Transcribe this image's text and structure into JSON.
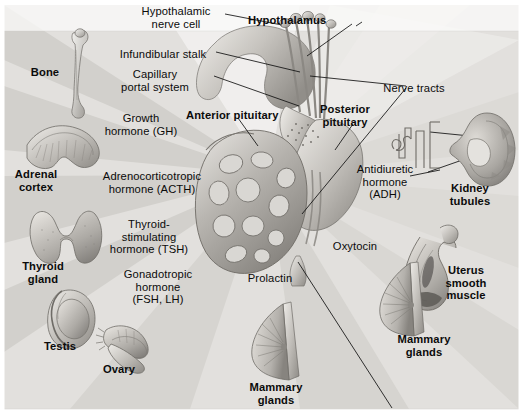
{
  "figure": {
    "width": 523,
    "height": 418,
    "background_color": "#e8e7e5",
    "border_color": "#ffffff",
    "line_color": "#1a1a1a"
  },
  "structures": [
    {
      "id": "hypothalamic-nerve-cell",
      "label": "Hypothalamic\nnerve cell",
      "bold": false,
      "x": 176,
      "y": 5,
      "anchor": "center"
    },
    {
      "id": "hypothalamus",
      "label": "Hypothalamus",
      "bold": true,
      "x": 248,
      "y": 14,
      "anchor": "left"
    },
    {
      "id": "infundibular-stalk",
      "label": "Infundibular stalk",
      "bold": false,
      "x": 163,
      "y": 48,
      "anchor": "center"
    },
    {
      "id": "nerve-tracts",
      "label": "Nerve tracts",
      "bold": false,
      "x": 414,
      "y": 82,
      "anchor": "center"
    },
    {
      "id": "capillary-portal-system",
      "label": "Capillary\nportal system",
      "bold": false,
      "x": 155,
      "y": 68,
      "anchor": "center"
    },
    {
      "id": "anterior-pituitary",
      "label": "Anterior pituitary",
      "bold": true,
      "x": 186,
      "y": 109,
      "anchor": "left"
    },
    {
      "id": "posterior-pituitary",
      "label": "Posterior\npituitary",
      "bold": true,
      "x": 345,
      "y": 103,
      "anchor": "center"
    }
  ],
  "hormones": [
    {
      "id": "growth-hormone",
      "label": "Growth\nhormone (GH)",
      "x": 141,
      "y": 112
    },
    {
      "id": "acth",
      "label": "Adrenocorticotropic\nhormone (ACTH)",
      "x": 152,
      "y": 170
    },
    {
      "id": "tsh",
      "label": "Thyroid-\nstimulating\nhormone (TSH)",
      "x": 149,
      "y": 218
    },
    {
      "id": "gonadotropic-hormone",
      "label": "Gonadotropic\nhormone\n(FSH, LH)",
      "x": 158,
      "y": 268
    },
    {
      "id": "prolactin",
      "label": "Prolactin",
      "x": 270,
      "y": 272
    },
    {
      "id": "oxytocin",
      "label": "Oxytocin",
      "x": 355,
      "y": 240
    },
    {
      "id": "adh",
      "label": "Antidiuretic\nhormone\n(ADH)",
      "x": 385,
      "y": 163
    }
  ],
  "target_organs": [
    {
      "id": "bone",
      "label": "Bone",
      "x": 45,
      "y": 66,
      "organ": "long-bone"
    },
    {
      "id": "adrenal-cortex",
      "label": "Adrenal\ncortex",
      "x": 36,
      "y": 168,
      "organ": "adrenal-gland"
    },
    {
      "id": "thyroid-gland",
      "label": "Thyroid\ngland",
      "x": 43,
      "y": 260,
      "organ": "thyroid"
    },
    {
      "id": "testis",
      "label": "Testis",
      "x": 60,
      "y": 340,
      "organ": "testis"
    },
    {
      "id": "ovary",
      "label": "Ovary",
      "x": 119,
      "y": 363,
      "organ": "ovary"
    },
    {
      "id": "mammary-glands-left",
      "label": "Mammary\nglands",
      "x": 276,
      "y": 381,
      "organ": "breast"
    },
    {
      "id": "mammary-glands-right",
      "label": "Mammary\nglands",
      "x": 424,
      "y": 333,
      "organ": "breast"
    },
    {
      "id": "uterus-smooth-muscle",
      "label": "Uterus\nsmooth\nmuscle",
      "x": 466,
      "y": 264,
      "organ": "uterus"
    },
    {
      "id": "kidney-tubules",
      "label": "Kidney\ntubules",
      "x": 470,
      "y": 182,
      "organ": "kidney"
    }
  ]
}
